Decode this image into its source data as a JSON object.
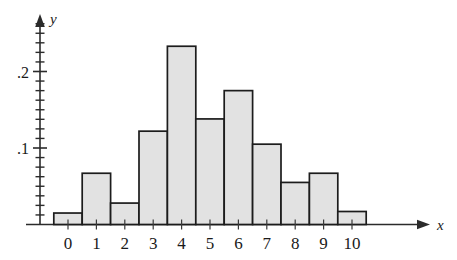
{
  "chart_data": {
    "type": "bar",
    "title": "",
    "subtitle": "",
    "xlabel": "x",
    "ylabel": "y",
    "categories": [
      "0",
      "1",
      "2",
      "3",
      "4",
      "5",
      "6",
      "7",
      "8",
      "9",
      "10"
    ],
    "values": [
      0.015,
      0.067,
      0.028,
      0.122,
      0.233,
      0.138,
      0.175,
      0.105,
      0.055,
      0.067,
      0.017
    ],
    "xlim": [
      -0.5,
      10.5
    ],
    "ylim": [
      0,
      0.26
    ],
    "y_tick_labels": [
      ".1",
      ".2"
    ],
    "y_tick_values": [
      0.1,
      0.2
    ],
    "y_minor_step": 0.0125,
    "grid": false,
    "legend": null,
    "bar_fill_color": "#e2e2e2",
    "bar_edge_color": "#1c1c1c",
    "axis_color": "#2b2b2b",
    "background_color": "#ffffff"
  },
  "axes": {
    "y_axis_name": "y",
    "x_axis_name": "x",
    "y_arrow": "arrow-up",
    "x_arrow": "arrow-right"
  },
  "y_ticks": [
    {
      "label": ".2",
      "value": 0.2
    },
    {
      "label": ".1",
      "value": 0.1
    }
  ],
  "x_ticks": [
    {
      "label": "0",
      "value": 0
    },
    {
      "label": "1",
      "value": 1
    },
    {
      "label": "2",
      "value": 2
    },
    {
      "label": "3",
      "value": 3
    },
    {
      "label": "4",
      "value": 4
    },
    {
      "label": "5",
      "value": 5
    },
    {
      "label": "6",
      "value": 6
    },
    {
      "label": "7",
      "value": 7
    },
    {
      "label": "8",
      "value": 8
    },
    {
      "label": "9",
      "value": 9
    },
    {
      "label": "10",
      "value": 10
    }
  ]
}
